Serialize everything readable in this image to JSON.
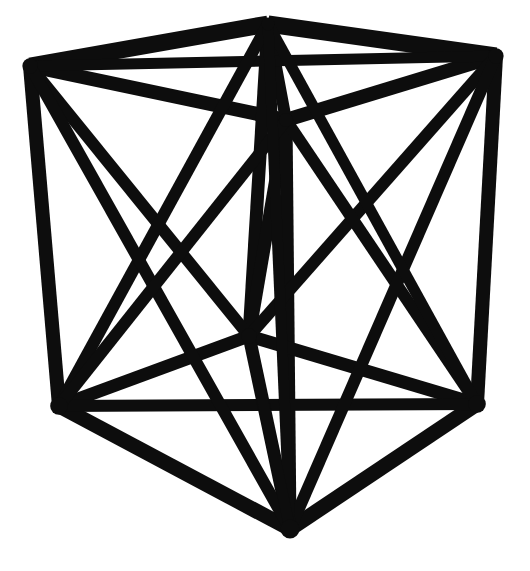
{
  "figure": {
    "kind": "line-art",
    "canvas": {
      "width": 530,
      "height": 571
    },
    "background_color": "#ffffff",
    "ink_color": "#0d0d0d",
    "stroke_weight_main": 13,
    "stroke_weight_diagonal": 11,
    "stroke_weight_thin": 9
  },
  "vertices": [
    {
      "id": "top-back-left",
      "label": "A",
      "x": 268,
      "y": 24,
      "blob": 11
    },
    {
      "id": "top-front-left",
      "label": "B",
      "x": 30,
      "y": 66,
      "blob": 13
    },
    {
      "id": "top-front-right",
      "label": "C",
      "x": 496,
      "y": 56,
      "blob": 13
    },
    {
      "id": "top-back-right",
      "label": "D",
      "x": 286,
      "y": 120,
      "blob": 12
    },
    {
      "id": "bottom-back",
      "label": "E",
      "x": 249,
      "y": 336,
      "blob": 13
    },
    {
      "id": "bottom-front-left",
      "label": "F",
      "x": 59,
      "y": 406,
      "blob": 15
    },
    {
      "id": "bottom-front-right",
      "label": "G",
      "x": 477,
      "y": 404,
      "blob": 15
    },
    {
      "id": "bottom-front",
      "label": "H",
      "x": 290,
      "y": 529,
      "blob": 16
    }
  ],
  "edges": [
    {
      "id": "top-edge-back-left",
      "from": "top-back-left",
      "to": "top-front-left",
      "w": 17
    },
    {
      "id": "top-edge-back-right",
      "from": "top-back-left",
      "to": "top-front-right",
      "w": 17
    },
    {
      "id": "top-edge-inner-left",
      "from": "top-back-right",
      "to": "top-front-left",
      "w": 14
    },
    {
      "id": "top-edge-inner-right",
      "from": "top-back-right",
      "to": "top-front-right",
      "w": 14
    },
    {
      "id": "top-diag-short",
      "from": "top-back-left",
      "to": "top-back-right",
      "w": 12
    },
    {
      "id": "top-diag-long",
      "from": "top-front-left",
      "to": "top-front-right",
      "w": 11
    },
    {
      "id": "vert-front-left",
      "from": "top-front-left",
      "to": "bottom-front-left",
      "w": 14
    },
    {
      "id": "vert-front-right",
      "from": "top-front-right",
      "to": "bottom-front-right",
      "w": 14
    },
    {
      "id": "vert-back-left",
      "from": "top-back-left",
      "to": "bottom-back",
      "w": 13
    },
    {
      "id": "vert-back-right",
      "from": "top-back-right",
      "to": "bottom-back",
      "w": 13
    },
    {
      "id": "vert-center-front",
      "from": "top-back-right",
      "to": "bottom-front",
      "w": 13
    },
    {
      "id": "bottom-edge-back-left",
      "from": "bottom-back",
      "to": "bottom-front-left",
      "w": 13
    },
    {
      "id": "bottom-edge-back-right",
      "from": "bottom-back",
      "to": "bottom-front-right",
      "w": 13
    },
    {
      "id": "bottom-edge-front-left",
      "from": "bottom-front",
      "to": "bottom-front-left",
      "w": 15
    },
    {
      "id": "bottom-edge-front-right",
      "from": "bottom-front",
      "to": "bottom-front-right",
      "w": 15
    },
    {
      "id": "bottom-span",
      "from": "bottom-front-left",
      "to": "bottom-front-right",
      "w": 12
    },
    {
      "id": "bottom-diag-center",
      "from": "bottom-front",
      "to": "bottom-back",
      "w": 13
    },
    {
      "id": "left-face-diag-a",
      "from": "top-front-left",
      "to": "bottom-back",
      "w": 12
    },
    {
      "id": "left-face-diag-b",
      "from": "top-back-left",
      "to": "bottom-front-left",
      "w": 12
    },
    {
      "id": "right-face-diag-a",
      "from": "top-front-right",
      "to": "bottom-back",
      "w": 12
    },
    {
      "id": "right-face-diag-b",
      "from": "top-back-right",
      "to": "bottom-front-right",
      "w": 12
    },
    {
      "id": "front-left-diag-a",
      "from": "top-front-left",
      "to": "bottom-front",
      "w": 12
    },
    {
      "id": "front-left-diag-b",
      "from": "top-back-right",
      "to": "bottom-front-left",
      "w": 12
    },
    {
      "id": "front-right-diag-a",
      "from": "top-front-right",
      "to": "bottom-front",
      "w": 12
    },
    {
      "id": "space-diag-left",
      "from": "top-back-left",
      "to": "bottom-front-right",
      "w": 11
    },
    {
      "id": "space-diag-right",
      "from": "top-back-left",
      "to": "bottom-front",
      "w": 11
    },
    {
      "id": "fan-left",
      "from": "bottom-front",
      "to": "bottom-back",
      "w": 11
    }
  ]
}
